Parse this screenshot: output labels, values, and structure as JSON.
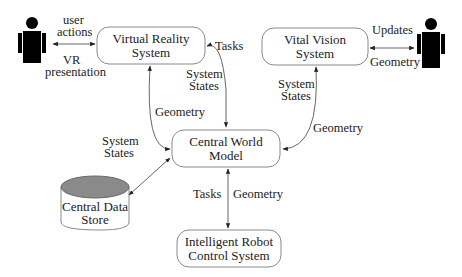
{
  "diagram": {
    "nodes": {
      "vr_system": {
        "line1": "Virtual Reality",
        "line2": "System"
      },
      "vital_vision": {
        "line1": "Vital Vision",
        "line2": "System"
      },
      "central_world": {
        "line1": "Central World",
        "line2": "Model"
      },
      "central_data": {
        "line1": "Central Data",
        "line2": "Store"
      },
      "robot_control": {
        "line1": "Intelligent Robot",
        "line2": "Control System"
      }
    },
    "actors": {
      "left_user": "person-icon",
      "right_user": "person-icon"
    },
    "edge_labels": {
      "user_actions_1": "user",
      "user_actions_2": "actions",
      "vr_presentation_1": "VR",
      "vr_presentation_2": "presentation",
      "vr_tasks": "Tasks",
      "vr_system_states_1": "System",
      "vr_system_states_2": "States",
      "vr_geometry": "Geometry",
      "vv_updates": "Updates",
      "vv_geometry_actor": "Geometry",
      "vv_system_states_1": "System",
      "vv_system_states_2": "States",
      "vv_geometry": "Geometry",
      "db_system_states_1": "System",
      "db_system_states_2": "States",
      "robot_tasks": "Tasks",
      "robot_geometry": "Geometry"
    },
    "colors": {
      "box_stroke": "#8a8a8a",
      "edge": "#555555",
      "db_top": "#8a8a8a",
      "person": "#000000"
    }
  }
}
